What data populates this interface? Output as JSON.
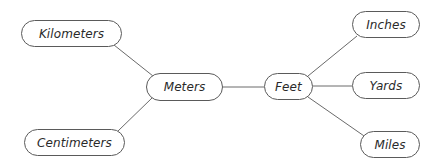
{
  "diagram": {
    "type": "unit-relationship-graph",
    "nodes": [
      {
        "id": "kilometers",
        "label": "Kilometers",
        "x": 21,
        "y": 20,
        "w": 101,
        "h": 27
      },
      {
        "id": "centimeters",
        "label": "Centimeters",
        "x": 24,
        "y": 129,
        "w": 101,
        "h": 27
      },
      {
        "id": "meters",
        "label": "Meters",
        "x": 146,
        "y": 73,
        "w": 77,
        "h": 28
      },
      {
        "id": "feet",
        "label": "Feet",
        "x": 264,
        "y": 73,
        "w": 49,
        "h": 27
      },
      {
        "id": "inches",
        "label": "Inches",
        "x": 352,
        "y": 11,
        "w": 68,
        "h": 27
      },
      {
        "id": "yards",
        "label": "Yards",
        "x": 352,
        "y": 72,
        "w": 68,
        "h": 27
      },
      {
        "id": "miles",
        "label": "Miles",
        "x": 360,
        "y": 131,
        "w": 60,
        "h": 27
      }
    ],
    "edges": [
      {
        "from": "kilometers",
        "to": "meters",
        "x1": 114,
        "y1": 45,
        "x2": 153,
        "y2": 76
      },
      {
        "from": "centimeters",
        "to": "meters",
        "x1": 118,
        "y1": 131,
        "x2": 152,
        "y2": 98
      },
      {
        "from": "meters",
        "to": "feet",
        "x1": 223,
        "y1": 87,
        "x2": 264,
        "y2": 87
      },
      {
        "from": "feet",
        "to": "inches",
        "x1": 308,
        "y1": 76,
        "x2": 357,
        "y2": 36
      },
      {
        "from": "feet",
        "to": "yards",
        "x1": 313,
        "y1": 86,
        "x2": 352,
        "y2": 86
      },
      {
        "from": "feet",
        "to": "miles",
        "x1": 308,
        "y1": 97,
        "x2": 367,
        "y2": 138
      }
    ]
  }
}
